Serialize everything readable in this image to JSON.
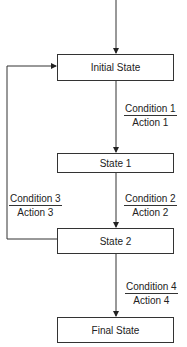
{
  "diagram": {
    "type": "state-transition-flowchart",
    "states": [
      {
        "id": "initial",
        "label": "Initial State"
      },
      {
        "id": "s1",
        "label": "State 1"
      },
      {
        "id": "s2",
        "label": "State 2"
      },
      {
        "id": "final",
        "label": "Final State"
      }
    ],
    "transitions": [
      {
        "from": "initial",
        "to": "s1",
        "condition": "Condition 1",
        "action": "Action 1"
      },
      {
        "from": "s1",
        "to": "s2",
        "condition": "Condition 2",
        "action": "Action 2"
      },
      {
        "from": "s2",
        "to": "initial",
        "condition": "Condition 3",
        "action": "Action 3"
      },
      {
        "from": "s2",
        "to": "final",
        "condition": "Condition 4",
        "action": "Action 4"
      }
    ],
    "colors": {
      "line": "#333333",
      "box_border": "#333333",
      "background": "#ffffff"
    }
  }
}
